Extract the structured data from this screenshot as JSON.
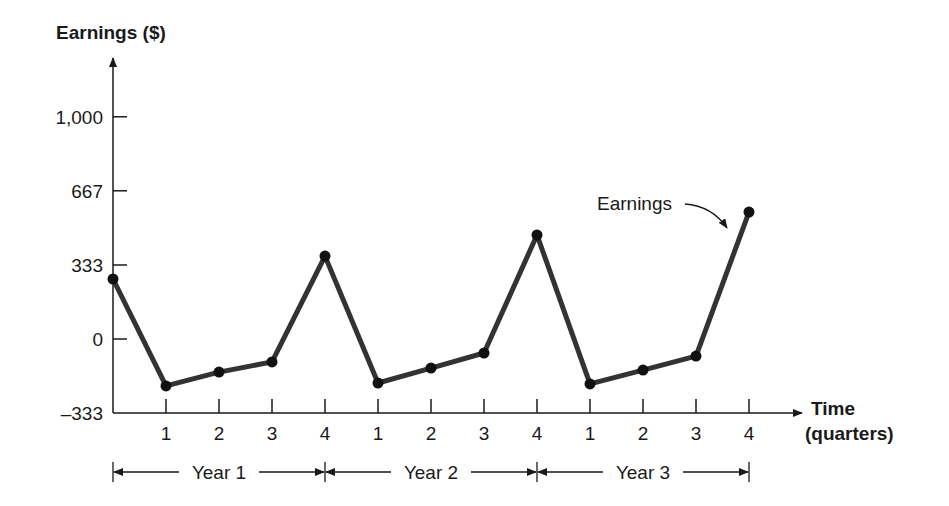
{
  "chart_data": {
    "type": "line",
    "title": "",
    "ylabel": "Earnings ($)",
    "xlabel_line1": "Time",
    "xlabel_line2": "(quarters)",
    "ylim": [
      -333,
      1100
    ],
    "yticks": [
      -333,
      0,
      333,
      667,
      1000
    ],
    "ytick_labels": [
      "–333",
      "0",
      "333",
      "667",
      "1,000"
    ],
    "x_tick_labels": [
      "1",
      "2",
      "3",
      "4",
      "1",
      "2",
      "3",
      "4",
      "1",
      "2",
      "3",
      "4"
    ],
    "years": [
      "Year 1",
      "Year 2",
      "Year 3"
    ],
    "grid": false,
    "legend": "none",
    "annotation": "Earnings",
    "series": [
      {
        "name": "Earnings",
        "x": [
          0,
          1,
          2,
          3,
          4,
          5,
          6,
          7,
          8,
          9,
          10,
          11,
          12
        ],
        "values": [
          270,
          -211,
          -149,
          -103,
          373,
          -198,
          -131,
          -63,
          468,
          -202,
          -140,
          -77,
          571
        ]
      }
    ],
    "colors": {
      "line": "#333333",
      "marker": "#111111",
      "axis": "#1a1a1a"
    }
  }
}
